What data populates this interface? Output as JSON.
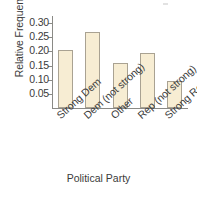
{
  "chart_data": {
    "type": "bar",
    "title": "",
    "xlabel": "Political Party",
    "ylabel": "Relative Frequency",
    "categories": [
      "Strong Dem",
      "Dem (not strong)",
      "Other",
      "Rep (not strong)",
      "Strong Rep"
    ],
    "values": [
      0.205,
      0.27,
      0.16,
      0.195,
      0.095
    ],
    "ylim": [
      0,
      0.325
    ],
    "ytick_labels": [
      "0.30",
      "0.25",
      "0.20",
      "0.15",
      "0.10",
      "0.05"
    ],
    "ytick_values": [
      0.3,
      0.25,
      0.2,
      0.15,
      0.1,
      0.05
    ],
    "grid": false,
    "legend": null,
    "bar_fill_color": "#f7edd3",
    "bar_edge_color": "#a9a292",
    "axis_color": "#8a8a86",
    "text_color": "#3b3b3b"
  }
}
